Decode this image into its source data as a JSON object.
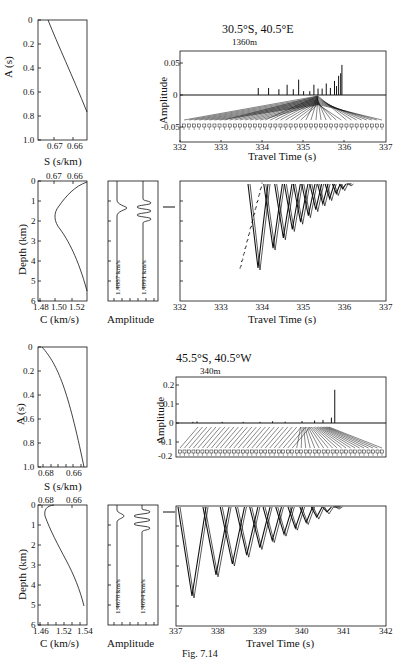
{
  "figure": {
    "caption": "Fig. 7.14",
    "panels": [
      {
        "location": "30.5°S, 40.5°E",
        "depth_label": "1360m",
        "profile_A": {
          "ylabel": "A (s)",
          "xlabel": "S (s/km)",
          "yticks": [
            "0",
            "0.2",
            "0.4",
            "0.6",
            "0.8",
            "1.0"
          ],
          "xticks": [
            "0.67",
            "0.66"
          ]
        },
        "profile_C": {
          "ylabel": "Depth (km)",
          "xlabel": "C (km/s)",
          "top_ticks": [
            "0.67",
            "0.66"
          ],
          "yticks": [
            "0",
            "1",
            "2",
            "3",
            "4",
            "5",
            "6"
          ],
          "xticks": [
            "1.48",
            "1.50",
            "1.52"
          ]
        },
        "amplitude_depth": {
          "xlabel": "Amplitude",
          "speed_left": "1.4887 km/s",
          "speed_right": "1.4891 km/s"
        },
        "trace": {
          "ylabel": "Amplitude",
          "xlabel": "Travel Time (s)",
          "yticks": [
            "0.05",
            "0",
            "-0.05"
          ],
          "xticks": [
            "332",
            "333",
            "334",
            "335",
            "336",
            "337"
          ]
        },
        "arrivals": {
          "xlabel": "Travel Time (s)",
          "xticks": [
            "332",
            "333",
            "334",
            "335",
            "336",
            "337"
          ]
        }
      },
      {
        "location": "45.5°S, 40.5°W",
        "depth_label": "340m",
        "profile_A": {
          "ylabel": "A (s)",
          "xlabel": "S (s/km)",
          "yticks": [
            "0",
            "0.2",
            "0.4",
            "0.6",
            "0.8",
            "1.0"
          ],
          "xticks": [
            "0.68",
            "0.66"
          ]
        },
        "profile_C": {
          "ylabel": "Depth (km)",
          "xlabel": "C (km/s)",
          "top_ticks": [
            "0.68",
            "0.66"
          ],
          "yticks": [
            "0",
            "1",
            "2",
            "3",
            "4",
            "5",
            "6"
          ],
          "xticks": [
            "1.46",
            "1.52",
            "1.54"
          ]
        },
        "amplitude_depth": {
          "xlabel": "Amplitude",
          "speed_left": "1.4678 km/s",
          "speed_right": "1.4694 km/s"
        },
        "trace": {
          "ylabel": "Amplitude",
          "xlabel": "Travel Time (s)",
          "yticks": [
            "0.2",
            "0.1",
            "0",
            "-0.1",
            "-0.2"
          ],
          "xticks": [
            "337",
            "338",
            "339",
            "340",
            "341",
            "342"
          ]
        },
        "arrivals": {
          "xlabel": "Travel Time (s)",
          "xticks": [
            "337",
            "338",
            "339",
            "340",
            "341",
            "342"
          ]
        }
      }
    ]
  },
  "chart_data": [
    {
      "type": "line",
      "title": "30.5°S, 40.5°E — A vs S",
      "xlabel": "S (s/km)",
      "ylabel": "A (s)",
      "x": [
        0.672,
        0.668,
        0.664,
        0.66,
        0.657
      ],
      "y": [
        0.0,
        0.15,
        0.33,
        0.53,
        0.73
      ],
      "ylim": [
        0,
        1.0
      ]
    },
    {
      "type": "line",
      "title": "30.5°S, 40.5°E — sound speed profile",
      "xlabel": "C (km/s)",
      "ylabel": "Depth (km)",
      "x": [
        1.531,
        1.51,
        1.495,
        1.488,
        1.489,
        1.5,
        1.515,
        1.531
      ],
      "y": [
        0.0,
        0.3,
        0.8,
        1.3,
        1.7,
        2.5,
        3.5,
        4.5
      ],
      "ylim": [
        6,
        0
      ]
    },
    {
      "type": "bar",
      "title": "30.5°S, 40.5°E — arrival amplitudes",
      "xlabel": "Travel Time (s)",
      "ylabel": "Amplitude",
      "x": [
        333.9,
        334.15,
        334.4,
        334.6,
        334.75,
        334.88,
        335.0,
        335.15,
        335.25,
        335.35,
        335.45,
        335.55,
        335.65,
        335.75,
        335.8,
        335.85,
        335.9,
        335.93
      ],
      "values": [
        0.011,
        0.011,
        0.009,
        0.016,
        0.009,
        0.024,
        0.006,
        0.006,
        0.016,
        0.01,
        0.01,
        0.018,
        0.011,
        0.022,
        0.014,
        0.03,
        0.034,
        0.047
      ],
      "xlim": [
        332,
        337
      ],
      "ylim": [
        -0.07,
        0.07
      ]
    },
    {
      "type": "scatter",
      "title": "30.5°S, 40.5°E — ray arrivals vs depth",
      "xlabel": "Travel Time (s)",
      "ylabel": "Depth (km)",
      "x_range": [
        333.55,
        335.95
      ],
      "y_range": [
        0,
        4.2
      ],
      "xlim": [
        332,
        337
      ],
      "ylim": [
        6,
        0
      ],
      "receiver_depth_km": 1.36
    },
    {
      "type": "line",
      "title": "45.5°S, 40.5°W — A vs S",
      "xlabel": "S (s/km)",
      "ylabel": "A (s)",
      "x": [
        0.683,
        0.675,
        0.668,
        0.662,
        0.656
      ],
      "y": [
        0.0,
        0.2,
        0.42,
        0.7,
        1.0
      ],
      "ylim": [
        0,
        1.0
      ]
    },
    {
      "type": "line",
      "title": "45.5°S, 40.5°W — sound speed profile",
      "xlabel": "C (km/s)",
      "ylabel": "Depth (km)",
      "x": [
        1.49,
        1.47,
        1.468,
        1.48,
        1.5,
        1.515,
        1.53,
        1.54
      ],
      "y": [
        0.0,
        0.1,
        0.5,
        1.0,
        1.8,
        2.8,
        4.0,
        5.0
      ],
      "ylim": [
        6,
        0
      ]
    },
    {
      "type": "bar",
      "title": "45.5°S, 40.5°W — arrival amplitudes",
      "xlabel": "Travel Time (s)",
      "ylabel": "Amplitude",
      "x": [
        337.4,
        337.5,
        338.1,
        338.6,
        339.0,
        339.3,
        339.6,
        340.0,
        340.3,
        340.5,
        340.7,
        340.78
      ],
      "values": [
        0.006,
        0.008,
        0.006,
        0.006,
        0.006,
        0.009,
        0.007,
        0.01,
        0.013,
        0.016,
        0.028,
        0.175
      ],
      "xlim": [
        337,
        342
      ],
      "ylim": [
        -0.25,
        0.25
      ]
    },
    {
      "type": "scatter",
      "title": "45.5°S, 40.5°W — ray arrivals vs depth",
      "xlabel": "Travel Time (s)",
      "ylabel": "Depth (km)",
      "x_range": [
        337.0,
        340.8
      ],
      "y_range": [
        0,
        3.7
      ],
      "xlim": [
        337,
        342
      ],
      "ylim": [
        6,
        0
      ],
      "receiver_depth_km": 0.34
    }
  ]
}
